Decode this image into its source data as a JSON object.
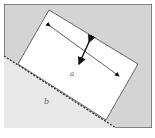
{
  "diagram": {
    "labels": {
      "region_a": "a",
      "region_b": "b"
    },
    "colors": {
      "background_gray": "#d4d4d4",
      "lower_region": "#e6e6e6",
      "rectangle_fill": "#ffffff",
      "border": "#333333",
      "arrow": "#111111"
    }
  },
  "caption": {
    "text": ""
  }
}
